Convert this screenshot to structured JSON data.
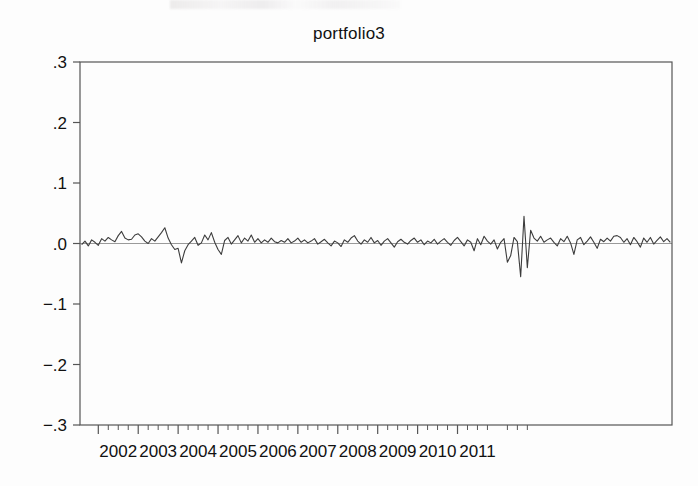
{
  "chart_data": {
    "type": "line",
    "title": "portfolio3",
    "xlabel": "",
    "ylabel": "",
    "ylim": [
      -0.3,
      0.3
    ],
    "xlim": [
      "2001.58",
      "2011.67"
    ],
    "grid": false,
    "legend": null,
    "y_ticks": [
      0.3,
      0.2,
      0.1,
      0.0,
      -0.1,
      -0.2,
      -0.3
    ],
    "y_tick_labels": [
      ".3",
      ".2",
      ".1",
      ".0",
      "−.1",
      "−.2",
      "−.3"
    ],
    "x_ticks": [
      2002,
      2003,
      2004,
      2005,
      2006,
      2007,
      2008,
      2009,
      2010,
      2011
    ],
    "x_tick_labels": [
      "2002",
      "2003",
      "2004",
      "2005",
      "2006",
      "2007",
      "2008",
      "2009",
      "2010",
      "2011"
    ],
    "minor_ticks_per_year": 4,
    "series_name": "portfolio3",
    "line_color": "#3c3c3c",
    "zero_line_color": "#9a9a9a",
    "frame_color": "#555555",
    "x_start": 2001.583,
    "x_step_years": 0.08333,
    "values": [
      -0.002,
      0.004,
      -0.004,
      0.006,
      0.002,
      -0.003,
      0.008,
      0.004,
      0.01,
      0.006,
      0.003,
      0.013,
      0.02,
      0.009,
      0.006,
      0.007,
      0.014,
      0.016,
      0.011,
      0.004,
      0.0,
      0.008,
      0.004,
      0.011,
      0.018,
      0.026,
      0.009,
      -0.002,
      -0.01,
      -0.008,
      -0.032,
      -0.012,
      -0.002,
      0.004,
      0.01,
      -0.003,
      0.001,
      0.014,
      0.006,
      0.018,
      0.002,
      -0.01,
      -0.018,
      0.005,
      0.01,
      -0.001,
      0.006,
      0.013,
      0.001,
      0.009,
      0.004,
      0.014,
      0.002,
      0.008,
      0.001,
      0.006,
      0.002,
      0.009,
      0.003,
      0.001,
      0.005,
      0.002,
      0.008,
      0.001,
      0.004,
      0.009,
      0.002,
      0.006,
      0.001,
      0.004,
      0.008,
      -0.001,
      0.003,
      0.007,
      0.001,
      -0.004,
      0.004,
      0.001,
      -0.005,
      0.006,
      0.002,
      0.009,
      0.013,
      0.004,
      -0.001,
      0.006,
      0.002,
      0.01,
      0.001,
      0.005,
      -0.003,
      0.004,
      0.008,
      0.001,
      -0.006,
      0.003,
      0.007,
      0.002,
      -0.001,
      0.005,
      0.009,
      0.002,
      0.006,
      -0.002,
      0.004,
      0.001,
      0.007,
      -0.001,
      0.004,
      0.008,
      0.002,
      -0.003,
      0.005,
      0.01,
      0.003,
      -0.004,
      0.006,
      0.002,
      -0.012,
      0.008,
      -0.002,
      0.012,
      0.004,
      -0.001,
      0.006,
      -0.009,
      0.002,
      0.008,
      -0.031,
      -0.02,
      0.01,
      0.003,
      -0.055,
      0.045,
      -0.04,
      0.022,
      0.009,
      0.004,
      0.012,
      0.002,
      0.006,
      0.009,
      0.002,
      -0.004,
      0.008,
      0.003,
      0.012,
      0.001,
      -0.018,
      0.006,
      0.01,
      -0.002,
      0.004,
      0.011,
      0.002,
      -0.008,
      0.007,
      0.003,
      0.009,
      0.004,
      0.012,
      0.013,
      0.01,
      0.002,
      0.008,
      -0.002,
      0.01,
      0.003,
      -0.006,
      0.009,
      0.002,
      0.01,
      -0.001,
      0.005,
      0.011,
      0.003,
      0.008,
      0.002
    ]
  }
}
